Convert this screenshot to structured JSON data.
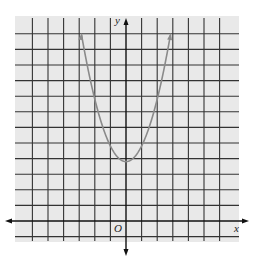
{
  "chart_data": {
    "type": "line",
    "title": "",
    "xlabel": "x",
    "ylabel": "y",
    "origin_label": "O",
    "grid": true,
    "xlim": [
      -7,
      7
    ],
    "ylim": [
      -1,
      12.5
    ],
    "series": [
      {
        "name": "parabola",
        "equation": "y = x^2 + 4",
        "x": [
          -2.8,
          -2.5,
          -2,
          -1.5,
          -1,
          -0.5,
          0,
          0.5,
          1,
          1.5,
          2,
          2.5,
          2.8
        ],
        "y": [
          11.84,
          10.25,
          8,
          6.25,
          5,
          4.25,
          4,
          4.25,
          5,
          6.25,
          8,
          10.25,
          11.84
        ],
        "arrows_at_ends": true
      }
    ]
  },
  "colors": {
    "background_panel": "#e9e9e9",
    "grid": "#333333",
    "axis": "#111111",
    "curve": "#8a8a8a"
  }
}
